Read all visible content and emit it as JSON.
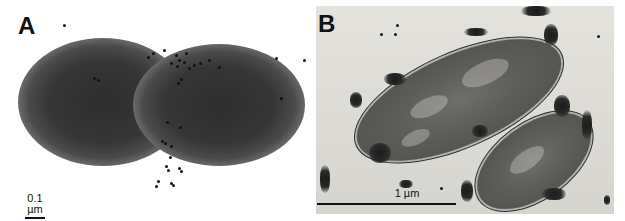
{
  "figure": {
    "panels": [
      {
        "label": "A",
        "description": "Negatively stained dividing bacterial cell (two lobes) with scattered gold particles",
        "scale_bar": {
          "text": "0.1 µm"
        }
      },
      {
        "label": "B",
        "description": "Thin-section micrograph of two bacterial cells with immunogold particles clustered on the cell surface",
        "scale_bar": {
          "text": "1 µm"
        }
      }
    ]
  },
  "colors": {
    "background": "#ffffff",
    "cell_dark": "#2e2e2e",
    "section_background": "#dedcd6",
    "gold_particle": "#111111",
    "label_text": "#111111"
  }
}
